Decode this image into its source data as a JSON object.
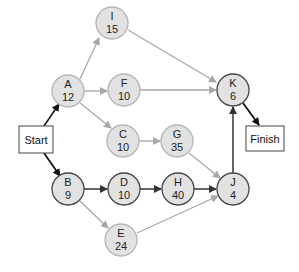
{
  "diagram": {
    "type": "activity-network",
    "start": {
      "label": "Start"
    },
    "finish": {
      "label": "Finish"
    },
    "nodes": [
      {
        "id": "I",
        "duration": "15",
        "critical": false
      },
      {
        "id": "A",
        "duration": "12",
        "critical": false
      },
      {
        "id": "F",
        "duration": "10",
        "critical": false
      },
      {
        "id": "C",
        "duration": "10",
        "critical": false
      },
      {
        "id": "G",
        "duration": "35",
        "critical": false
      },
      {
        "id": "K",
        "duration": "6",
        "critical": true
      },
      {
        "id": "B",
        "duration": "9",
        "critical": true
      },
      {
        "id": "D",
        "duration": "10",
        "critical": true
      },
      {
        "id": "H",
        "duration": "40",
        "critical": true
      },
      {
        "id": "J",
        "duration": "4",
        "critical": true
      },
      {
        "id": "E",
        "duration": "24",
        "critical": false
      }
    ],
    "edges": [
      {
        "from": "Start",
        "to": "A",
        "critical": false
      },
      {
        "from": "Start",
        "to": "B",
        "critical": true
      },
      {
        "from": "A",
        "to": "I",
        "critical": false
      },
      {
        "from": "A",
        "to": "F",
        "critical": false
      },
      {
        "from": "A",
        "to": "C",
        "critical": false
      },
      {
        "from": "I",
        "to": "K",
        "critical": false
      },
      {
        "from": "F",
        "to": "K",
        "critical": false
      },
      {
        "from": "C",
        "to": "G",
        "critical": false
      },
      {
        "from": "G",
        "to": "J",
        "critical": false
      },
      {
        "from": "B",
        "to": "D",
        "critical": true
      },
      {
        "from": "B",
        "to": "E",
        "critical": false
      },
      {
        "from": "D",
        "to": "H",
        "critical": true
      },
      {
        "from": "H",
        "to": "J",
        "critical": true
      },
      {
        "from": "E",
        "to": "J",
        "critical": false
      },
      {
        "from": "J",
        "to": "K",
        "critical": true
      },
      {
        "from": "K",
        "to": "Finish",
        "critical": true
      }
    ],
    "colors": {
      "node_fill": "#e2e2e2",
      "critical_stroke": "#444444",
      "noncritical_stroke": "#b5b5b5",
      "critical_edge": "#333333",
      "noncritical_edge": "#a8a8a8",
      "start_edge": "#000000"
    }
  }
}
